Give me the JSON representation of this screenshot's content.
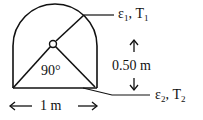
{
  "figure": {
    "angle_label": "90°",
    "width_label": "1 m",
    "height_label": "0.50 m",
    "surface1": {
      "emissivity_symbol": "ε",
      "emissivity_sub": "1",
      "temp_symbol": "T",
      "temp_sub": "1"
    },
    "surface2": {
      "emissivity_symbol": "ε",
      "emissivity_sub": "2",
      "temp_symbol": "T",
      "temp_sub": "2"
    }
  },
  "colors": {
    "stroke": "#111111",
    "background": "#ffffff"
  }
}
